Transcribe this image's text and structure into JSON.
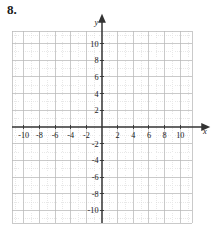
{
  "exercise": {
    "number": "8."
  },
  "chart_data": {
    "type": "scatter",
    "title": "",
    "subtitle": "",
    "xlabel": "x",
    "ylabel": "y",
    "xlim": [
      -11.5,
      11.5
    ],
    "ylim": [
      -11.5,
      11.5
    ],
    "grid": true,
    "minor_grid_step": 1,
    "major_grid_step": 2,
    "legend": "none",
    "series": [],
    "values": [],
    "x": [],
    "annotations": [],
    "x_tick_labels": [
      "-10",
      "-8",
      "-6",
      "-4",
      "-2",
      "2",
      "4",
      "6",
      "8",
      "10"
    ],
    "x_tick_values": [
      -10,
      -8,
      -6,
      -4,
      -2,
      2,
      4,
      6,
      8,
      10
    ],
    "y_tick_labels": [
      "10",
      "8",
      "6",
      "4",
      "2",
      "-2",
      "-4",
      "-6",
      "-8",
      "-10"
    ],
    "y_tick_values": [
      10,
      8,
      6,
      4,
      2,
      -2,
      -4,
      -6,
      -8,
      -10
    ],
    "axis_arrow_x": "right",
    "axis_arrow_y": "up",
    "colors": {
      "axis": "#333333",
      "major_grid": "#b8b8b8",
      "minor_grid": "#d8d8d8",
      "text": "#1a1a1a",
      "background": "#ffffff"
    }
  }
}
